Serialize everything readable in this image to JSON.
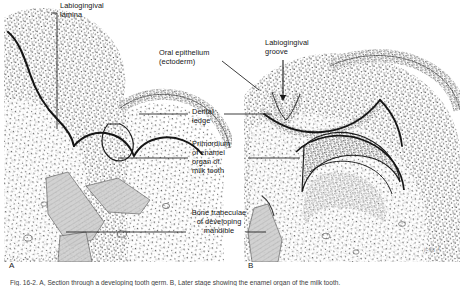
{
  "figure": {
    "background_color": "#ffffff",
    "ink_color": "#1a1a1a",
    "panels": [
      {
        "id": "A",
        "label": "A",
        "x": 9,
        "y": 262
      },
      {
        "id": "B",
        "label": "B",
        "x": 248,
        "y": 262
      }
    ],
    "labels": [
      {
        "name": "labiogingival-lamina",
        "lines": [
          "Labiogingival",
          "lamina"
        ],
        "x": 60,
        "y": 5,
        "align": "left",
        "leader": {
          "type": "elbow-down",
          "from_x": 57,
          "from_y": 12,
          "to_x": 57,
          "to_y": 129
        }
      },
      {
        "name": "oral-epithelium-ectoderm",
        "lines": [
          "Oral epithelium",
          "(ectoderm)"
        ],
        "x": 160,
        "y": 52,
        "align": "left",
        "leader": {
          "type": "diagonal",
          "from_x": 223,
          "from_y": 62,
          "to_x": 258,
          "to_y": 90
        }
      },
      {
        "name": "labiogingival-groove",
        "lines": [
          "Labiogingival",
          "groove"
        ],
        "x": 267,
        "y": 42,
        "align": "left",
        "leader": {
          "type": "arrow-down",
          "from_x": 282,
          "from_y": 60,
          "to_x": 282,
          "to_y": 100
        }
      },
      {
        "name": "dental-ledge",
        "lines": [
          "Dental",
          "ledge"
        ],
        "x": 192,
        "y": 110,
        "align": "left",
        "leader": {
          "type": "double-horizontal",
          "left_x1": 140,
          "left_x2": 188,
          "right_x1": 222,
          "right_x2": 268,
          "y": 114
        }
      },
      {
        "name": "primordium-enamel-organ-milk-tooth",
        "lines": [
          "Primordium",
          "of enamel",
          "organ of",
          "milk tooth"
        ],
        "x": 192,
        "y": 145,
        "align": "left",
        "leader": {
          "type": "double-horizontal",
          "left_x1": 120,
          "left_x2": 188,
          "right_x1": 245,
          "right_x2": 290,
          "y": 158
        }
      },
      {
        "name": "bone-trabeculae-developing-mandible",
        "lines": [
          "Bone trabeculae",
          "of developing",
          "mandible"
        ],
        "x": 192,
        "y": 212,
        "align": "center",
        "leader": {
          "type": "double-horizontal",
          "left_x1": 72,
          "left_x2": 188,
          "right_x1": 248,
          "right_x2": 268,
          "y": 232
        }
      }
    ],
    "signature": {
      "name": "artist-mark",
      "text": "jc4g 4",
      "x": 424,
      "y": 249
    },
    "caption": "Fig. 16-2.  A, Section through a developing tooth germ. B, Later stage showing the enamel organ of the milk tooth."
  }
}
